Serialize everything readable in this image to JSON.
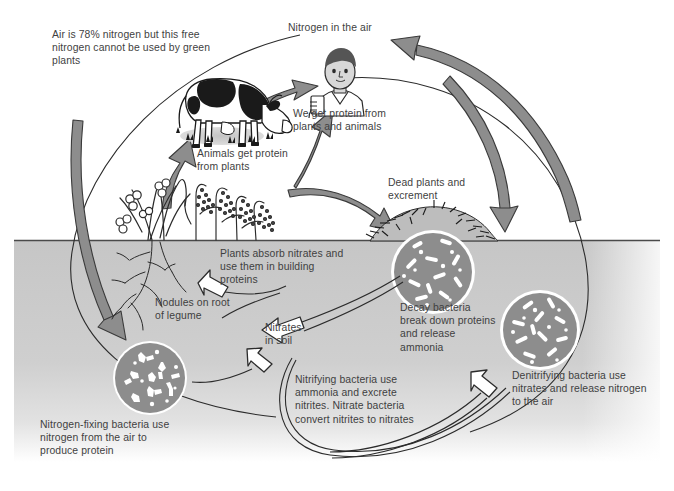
{
  "diagram": {
    "canvas": {
      "width": 674,
      "height": 491
    },
    "palette": {
      "background": "#ffffff",
      "soil_fill": "#c9c9c9",
      "soil_line": "#4a4a4a",
      "text": "#3f3f3f",
      "thick_arrow_fill": "#8d8d8d",
      "thick_arrow_stroke": "#3a3a3a",
      "hollow_arrow_fill": "#ffffff",
      "hollow_arrow_stroke": "#2b2b2b",
      "bacteria_circle_fill": "#8d8d8d",
      "bacteria_circle_ring": "#ffffff",
      "bacteria_glyph": "#ffffff",
      "thin_line": "#2b2b2b",
      "cow_dark": "#1a1a1a",
      "cow_light": "#ffffff",
      "plant_stroke": "#2b2b2b",
      "skin": "#d8d8d8",
      "hair": "#555555"
    },
    "soil": {
      "label": "soil-region",
      "surface_y": 240,
      "fade_bottom_y": 462
    }
  },
  "labels": {
    "air_nitrogen_note": "Air is 78% nitrogen but this free\nnitrogen cannot be used by green\nplants",
    "nitrogen_in_air": "Nitrogen in the air",
    "we_get_protein": "We get protein from\nplants and animals",
    "animals_get_protein": "Animals get protein\nfrom plants",
    "dead_plants": "Dead plants and\nexcrement",
    "plants_absorb": "Plants absorb nitrates and\nuse them in building\nproteins",
    "nodules": "Nodules on root\nof legume",
    "nitrates_in_soil": "Nitrates\nin soil",
    "decay_bacteria": "Decay bacteria\nbreak down proteins\nand release\nammonia",
    "denitrifying_bacteria": "Denitrifying bacteria use\nnitrates and release nitrogen\nto the air",
    "nitrifying_bacteria": "Nitrifying bacteria use\nammonia and excrete\nnitrites. Nitrate bacteria\nconvert nitrites to nitrates",
    "nitrogen_fixing_bacteria": "Nitrogen-fixing bacteria use\nnitrogen from the air to\nproduce protein"
  },
  "figures": {
    "cow": "cow-illustration",
    "person": "person-illustration",
    "legume_plant": "legume-plant-illustration",
    "grass_plants": "grass-plants-illustration",
    "root_system": "root-system-illustration",
    "dead_matter_pile": "dead-plant-matter-illustration",
    "bacteria_colonies": [
      {
        "name": "nitrogen-fixing-bacteria-circle",
        "cx": 150,
        "cy": 378,
        "r": 36,
        "glyph": "y-shaped"
      },
      {
        "name": "decay-bacteria-circle",
        "cx": 433,
        "cy": 272,
        "r": 40,
        "glyph": "rod-shaped"
      },
      {
        "name": "denitrifying-bacteria-circle",
        "cx": 540,
        "cy": 330,
        "r": 37,
        "glyph": "rod-shaped"
      }
    ]
  },
  "arrows": {
    "thick": [
      {
        "name": "arrow-plants-to-cow",
        "from": "plants",
        "to": "cow"
      },
      {
        "name": "arrow-cow-to-person",
        "from": "cow",
        "to": "person"
      },
      {
        "name": "arrow-plants-to-person",
        "from": "plants",
        "to": "person"
      },
      {
        "name": "arrow-plants-to-dead-matter",
        "from": "plants",
        "to": "dead-matter"
      },
      {
        "name": "arrow-dead-matter-to-air",
        "from": "dead-matter",
        "to": "nitrogen-in-air"
      },
      {
        "name": "arrow-person-to-dead-matter",
        "from": "person-area",
        "to": "dead-matter"
      },
      {
        "name": "arrow-air-to-nitrogen-fixing-bacteria",
        "from": "air",
        "to": "nitrogen-fixing-bacteria"
      }
    ],
    "hollow": [
      {
        "name": "arrow-nitrates-to-plants",
        "from": "nitrates-in-soil",
        "to": "plants"
      },
      {
        "name": "arrow-decay-to-nitrates",
        "from": "decay-bacteria",
        "to": "nitrates-in-soil"
      },
      {
        "name": "arrow-nitrifying-to-nitrates",
        "from": "nitrifying-process",
        "to": "nitrates-in-soil"
      },
      {
        "name": "arrow-nitrates-to-denitrifying",
        "from": "nitrates",
        "to": "denitrifying-bacteria"
      }
    ],
    "thin": [
      {
        "name": "outer-cycle-arc-left",
        "desc": "thin outline arc left side"
      },
      {
        "name": "outer-cycle-arc-right",
        "desc": "thin outline arc right side"
      },
      {
        "name": "leader-line-nodules",
        "desc": "pointer to nodules"
      },
      {
        "name": "leader-line-decay",
        "desc": "pointer to decay bacteria"
      }
    ]
  }
}
